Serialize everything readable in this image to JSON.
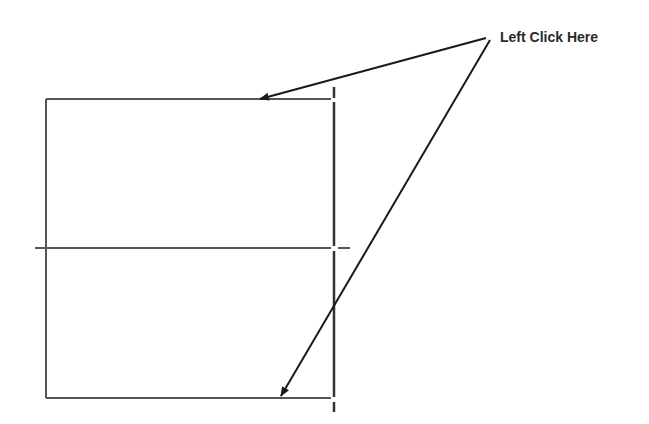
{
  "instruction": {
    "text": "Left Click Here",
    "position": {
      "x": 500,
      "y": 30
    }
  },
  "drawing": {
    "line_color": "#555555",
    "arrow_color": "#1a1a1a",
    "rectangle": {
      "left": 46,
      "top": 99,
      "right": 334,
      "bottom": 398
    },
    "midline_y": 248,
    "midline_x_start": 35,
    "midline_x_end": 350,
    "centerline_x": 334,
    "centerline_y_start": 87,
    "centerline_y_end": 412
  },
  "arrows": [
    {
      "name": "arrow-to-top-edge",
      "from": [
        486,
        38
      ],
      "to": [
        260,
        100
      ]
    },
    {
      "name": "arrow-to-bottom-edge",
      "from": [
        490,
        40
      ],
      "to": [
        281,
        397
      ]
    }
  ]
}
